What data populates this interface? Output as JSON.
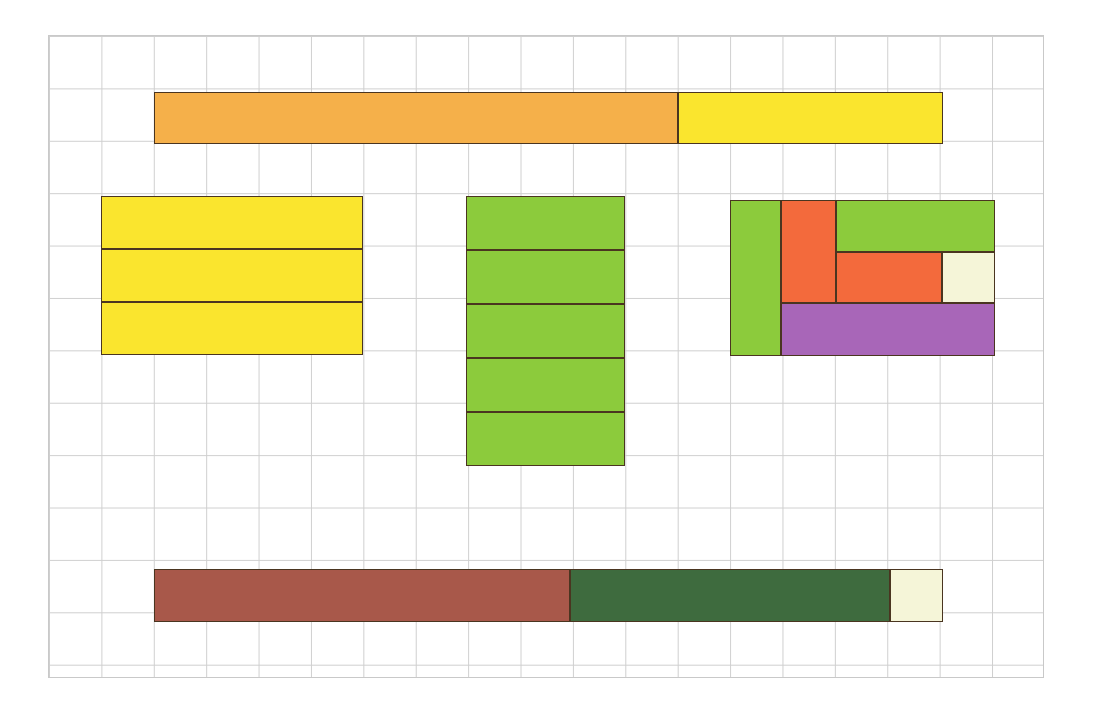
{
  "figure": {
    "type": "area-model-grid",
    "canvas": {
      "width": 1094,
      "height": 712,
      "background": "#ffffff"
    },
    "grid": {
      "x": 48,
      "y": 35,
      "width": 996,
      "height": 643,
      "cell_size": 52.4,
      "columns": 19,
      "rows": 12,
      "line_color": "#cfcfcf",
      "border_color": "#c9c9c9"
    },
    "palette": {
      "orange": "#F5B04A",
      "yellow": "#FAE52E",
      "green": "#8CCB3C",
      "red_orange": "#F36A3C",
      "cream": "#F5F5D8",
      "purple": "#A866B8",
      "brown": "#A8584A",
      "dark_green": "#3E6B3E",
      "outline": "#4a3520"
    },
    "shapes": [
      {
        "name": "top-bar",
        "label": "Top horizontal two-colour bar",
        "x": 154,
        "y": 92,
        "width": 789,
        "height": 52,
        "parts": [
          {
            "name": "top-bar-orange",
            "color": "#F5B04A",
            "x": 0,
            "y": 0,
            "width": 524,
            "height": 52,
            "units": 10
          },
          {
            "name": "top-bar-yellow",
            "color": "#FAE52E",
            "x": 524,
            "y": 0,
            "width": 265,
            "height": 52,
            "units": 5
          }
        ]
      },
      {
        "name": "yellow-block",
        "label": "Yellow 5x3 block",
        "x": 101,
        "y": 196,
        "width": 262,
        "height": 159,
        "parts": [
          {
            "name": "yellow-row-1",
            "color": "#FAE52E",
            "x": 0,
            "y": 0,
            "width": 262,
            "height": 53,
            "units": 5
          },
          {
            "name": "yellow-row-2",
            "color": "#FAE52E",
            "x": 0,
            "y": 53,
            "width": 262,
            "height": 53,
            "units": 5
          },
          {
            "name": "yellow-row-3",
            "color": "#FAE52E",
            "x": 0,
            "y": 106,
            "width": 262,
            "height": 53,
            "units": 5
          }
        ]
      },
      {
        "name": "green-block",
        "label": "Green 3x5 block",
        "x": 466,
        "y": 196,
        "width": 159,
        "height": 270,
        "parts": [
          {
            "name": "green-row-1",
            "color": "#8CCB3C",
            "x": 0,
            "y": 0,
            "width": 159,
            "height": 54,
            "units": 3
          },
          {
            "name": "green-row-2",
            "color": "#8CCB3C",
            "x": 0,
            "y": 54,
            "width": 159,
            "height": 54,
            "units": 3
          },
          {
            "name": "green-row-3",
            "color": "#8CCB3C",
            "x": 0,
            "y": 108,
            "width": 159,
            "height": 54,
            "units": 3
          },
          {
            "name": "green-row-4",
            "color": "#8CCB3C",
            "x": 0,
            "y": 162,
            "width": 159,
            "height": 54,
            "units": 3
          },
          {
            "name": "green-row-5",
            "color": "#8CCB3C",
            "x": 0,
            "y": 216,
            "width": 159,
            "height": 54,
            "units": 3
          }
        ]
      },
      {
        "name": "mixed-block",
        "label": "Multicolour partitioned 5x3 block",
        "x": 730,
        "y": 200,
        "width": 265,
        "height": 156,
        "parts": [
          {
            "name": "mixed-green-left",
            "color": "#8CCB3C",
            "x": 0,
            "y": 0,
            "width": 51,
            "height": 156,
            "units": 3
          },
          {
            "name": "mixed-redorange-tall",
            "color": "#F36A3C",
            "x": 51,
            "y": 0,
            "width": 55,
            "height": 103,
            "units": 2
          },
          {
            "name": "mixed-green-top",
            "color": "#8CCB3C",
            "x": 106,
            "y": 0,
            "width": 159,
            "height": 52,
            "units": 3
          },
          {
            "name": "mixed-redorange-mid",
            "color": "#F36A3C",
            "x": 106,
            "y": 52,
            "width": 106,
            "height": 51,
            "units": 2
          },
          {
            "name": "mixed-cream",
            "color": "#F5F5D8",
            "x": 212,
            "y": 52,
            "width": 53,
            "height": 51,
            "units": 1
          },
          {
            "name": "mixed-purple",
            "color": "#A866B8",
            "x": 51,
            "y": 103,
            "width": 214,
            "height": 53,
            "units": 4
          }
        ]
      },
      {
        "name": "bottom-bar",
        "label": "Bottom horizontal three-colour bar",
        "x": 154,
        "y": 569,
        "width": 789,
        "height": 53,
        "parts": [
          {
            "name": "bottom-bar-brown",
            "color": "#A8584A",
            "x": 0,
            "y": 0,
            "width": 416,
            "height": 53,
            "units": 8
          },
          {
            "name": "bottom-bar-darkgreen",
            "color": "#3E6B3E",
            "x": 416,
            "y": 0,
            "width": 320,
            "height": 53,
            "units": 6
          },
          {
            "name": "bottom-bar-cream",
            "color": "#F5F5D8",
            "x": 736,
            "y": 0,
            "width": 53,
            "height": 53,
            "units": 1
          }
        ]
      }
    ]
  }
}
